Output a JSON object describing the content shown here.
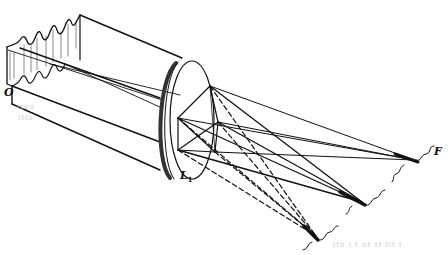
{
  "figure": {
    "type": "optics-diagram",
    "colors": {
      "ink": "#111111",
      "background": "#ffffff",
      "faint": "#c8c8c8"
    }
  },
  "labels": {
    "object": "O",
    "lens_main": "L",
    "lens_sub": "1",
    "focus": "F"
  },
  "faint_text": {
    "left_line1": "ttsu",
    "left_line2": "itio",
    "bottom_right": "ith  i  t     ut   tf  lit  i"
  },
  "elements": {
    "wavefront": "wavy sheet wavefront at object O",
    "beam": "parallel beam bands toward lens",
    "lens": "converging lens L1",
    "solid_rays": "solid rays converging to focus F and second focus",
    "dashed_rays": "dashed rays converging to lower focus"
  }
}
